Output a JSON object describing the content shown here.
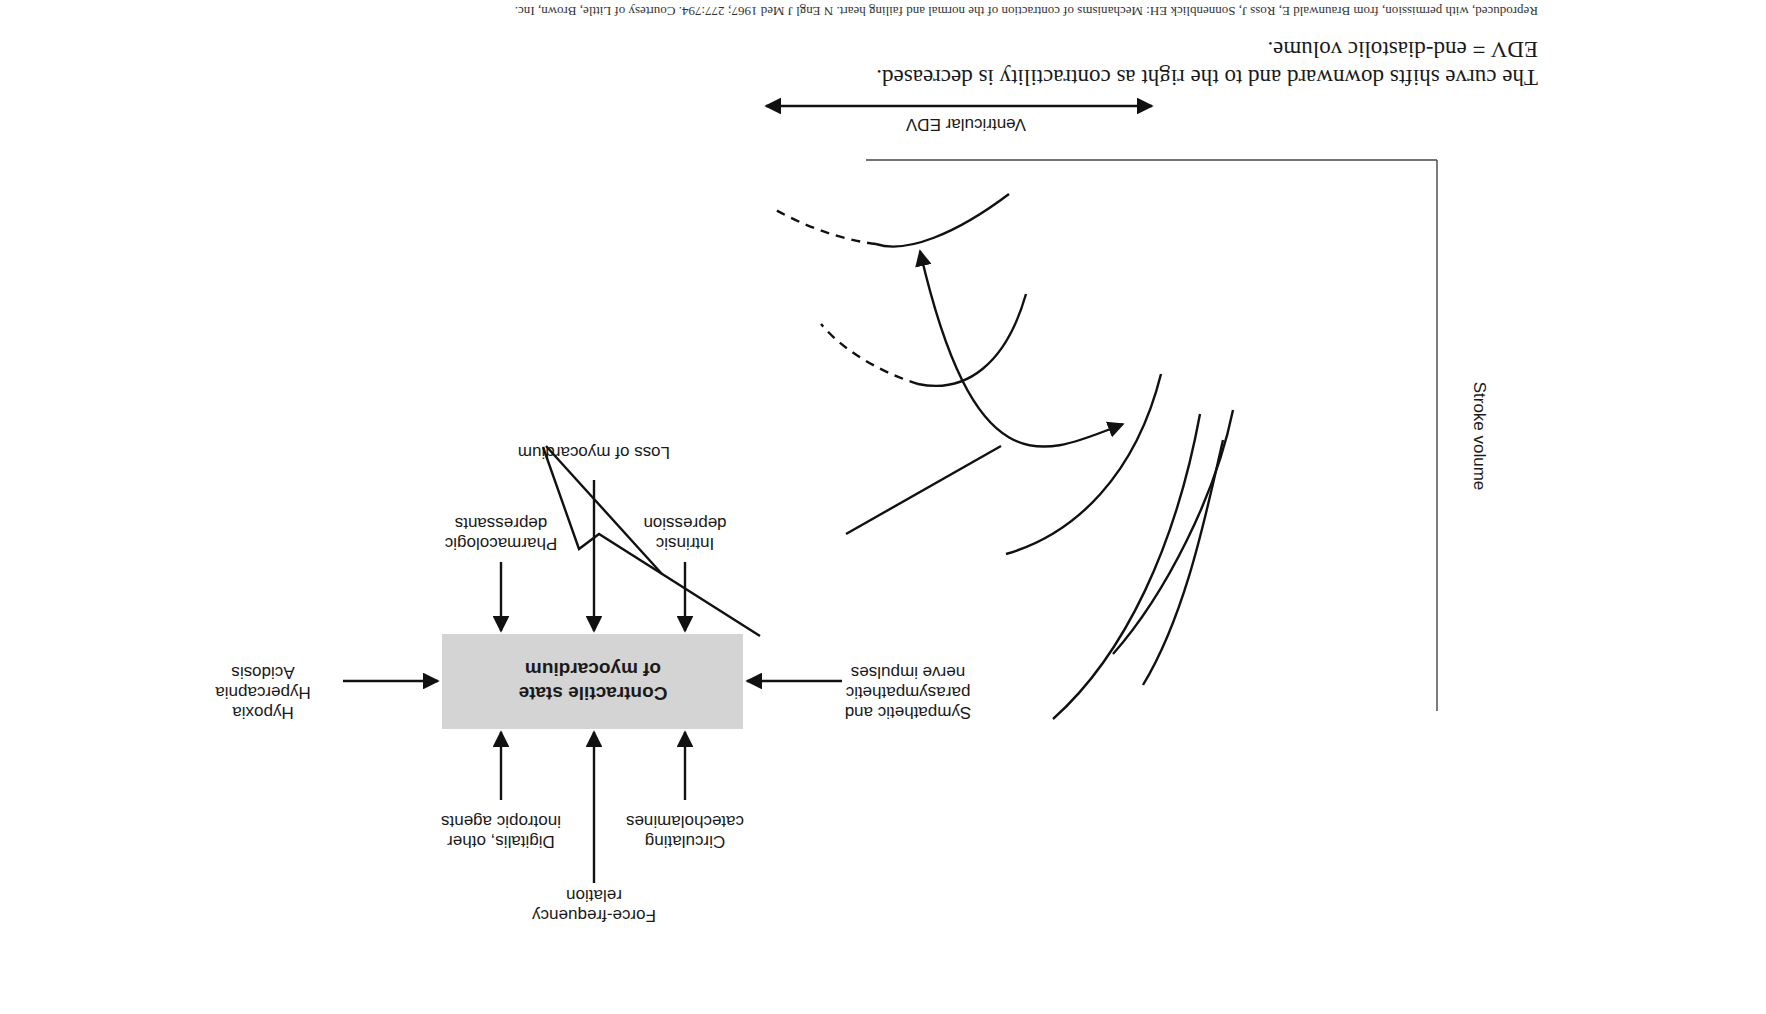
{
  "figure": {
    "orientation": "rotated 180 degrees",
    "central_box": {
      "line1": "Contractile state",
      "line2": "of myocardium",
      "fill": "#d4d4d4"
    },
    "inputs_top": [
      {
        "lines": [
          "Pharmacologic",
          "depressants"
        ],
        "effect": "decrease"
      },
      {
        "lines": [
          "Loss of myocardium"
        ],
        "effect": "decrease"
      },
      {
        "lines": [
          "Intrinsic",
          "depression"
        ],
        "effect": "decrease"
      }
    ],
    "inputs_bottom": [
      {
        "lines": [
          "Digitalis, other",
          "inotropic agents"
        ],
        "effect": "increase"
      },
      {
        "lines": [
          "Force-frequency",
          "relation"
        ],
        "effect": "increase"
      },
      {
        "lines": [
          "Circulating",
          "catecholamines"
        ],
        "effect": "increase"
      }
    ],
    "input_left": {
      "lines": [
        "Hypoxia",
        "Hypercapnia",
        "Acidosis"
      ]
    },
    "input_right": {
      "lines": [
        "Sympathetic and",
        "parasympathetic",
        "nerve impulses"
      ]
    },
    "graph": {
      "x_axis_label": "Ventricular EDV",
      "y_axis_label": "Stroke volume",
      "curve_count": 4,
      "dashed_segments": 2
    }
  },
  "caption": {
    "line1": "The curve shifts downward and to the right as contractility is decreased.",
    "line2": "EDV = end-diastolic volume.",
    "reference": "Reproduced, with permission, from Braunwald E, Ross J, Sonnenblick EH: Mechanisms of contraction of the normal and failing heart. N Engl J Med 1967; 277:794. Courtesy of Little, Brown, Inc."
  }
}
